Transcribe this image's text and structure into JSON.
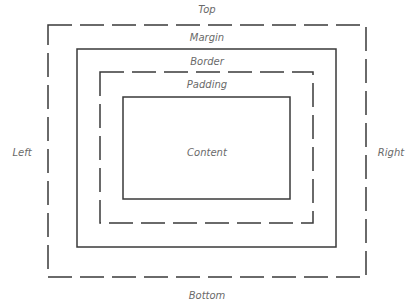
{
  "diagram": {
    "colors": {
      "stroke": "#3a3a3a",
      "label": "#6a6a6a",
      "background": "#ffffff"
    },
    "labels": {
      "top": "Top",
      "bottom": "Bottom",
      "left": "Left",
      "right": "Right",
      "margin": "Margin",
      "border": "Border",
      "padding": "Padding",
      "content": "Content"
    },
    "boxes": [
      {
        "name": "margin-edge",
        "style": "dashed",
        "x": 48,
        "y": 25,
        "w": 318,
        "h": 252
      },
      {
        "name": "border-box",
        "style": "solid",
        "x": 77,
        "y": 49,
        "w": 259,
        "h": 198
      },
      {
        "name": "padding-edge",
        "style": "dashed",
        "x": 100,
        "y": 72,
        "w": 213,
        "h": 151
      },
      {
        "name": "content-box",
        "style": "solid",
        "x": 123,
        "y": 97,
        "w": 167,
        "h": 102
      }
    ]
  }
}
